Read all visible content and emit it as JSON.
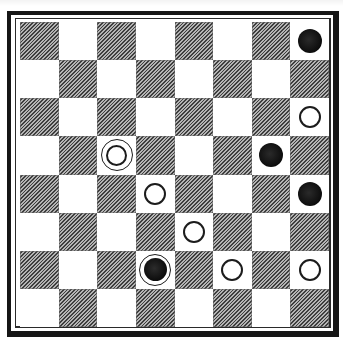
{
  "diagram": {
    "type": "checkers-position",
    "board_size": 8,
    "colors": {
      "light_square": "#ffffff",
      "dark_square_hatch": "#8d8d8d",
      "frame": "#161616",
      "black_piece": "#0c0c0c",
      "white_piece_stroke": "#1c1c1c"
    },
    "square_pattern": "row 0 starts with a dark square at column 0; pieces occupy light squares",
    "pieces": [
      {
        "row": 0,
        "col": 7,
        "kind": "black-man"
      },
      {
        "row": 2,
        "col": 7,
        "kind": "white-man"
      },
      {
        "row": 3,
        "col": 2,
        "kind": "white-king"
      },
      {
        "row": 3,
        "col": 6,
        "kind": "black-man"
      },
      {
        "row": 4,
        "col": 3,
        "kind": "white-man"
      },
      {
        "row": 4,
        "col": 7,
        "kind": "black-man"
      },
      {
        "row": 5,
        "col": 4,
        "kind": "white-man"
      },
      {
        "row": 6,
        "col": 3,
        "kind": "black-king"
      },
      {
        "row": 6,
        "col": 5,
        "kind": "white-man"
      },
      {
        "row": 6,
        "col": 7,
        "kind": "white-man"
      }
    ],
    "piece_counts": {
      "black_men": 3,
      "black_kings": 1,
      "white_men": 5,
      "white_kings": 1
    }
  }
}
